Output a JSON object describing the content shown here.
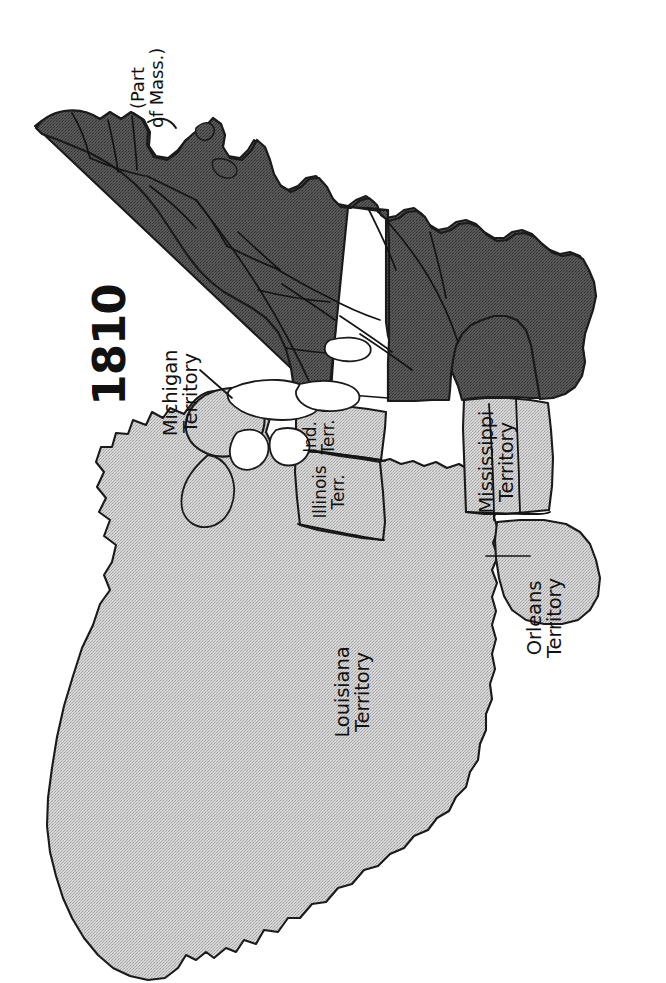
{
  "map": {
    "title": "1810",
    "subject": "United States territorial map, 1810",
    "orientation_degrees": -90,
    "background_color": "#ffffff",
    "colors": {
      "states_fill": "#4f4f4f",
      "territory_fill": "#c9c9c9",
      "outline": "#1a1a1a",
      "label_text": "#111111"
    },
    "labels": [
      {
        "id": "title",
        "text": "1810",
        "x": 110,
        "y": 345,
        "style": "title"
      },
      {
        "id": "part-of-mass",
        "line1": "(Part",
        "line2": "of Mass.)",
        "x": 148,
        "y": 88,
        "style": "note"
      },
      {
        "id": "michigan-territory",
        "line1": "Michigan",
        "line2": "Territory",
        "x": 181,
        "y": 393,
        "style": "terr"
      },
      {
        "id": "indiana-territory",
        "line1": "Ind.",
        "line2": "Terr.",
        "x": 320,
        "y": 437,
        "style": "terr-sm"
      },
      {
        "id": "illinois-territory",
        "line1": "Illinois",
        "line2": "Terr.",
        "x": 330,
        "y": 492,
        "style": "terr-sm"
      },
      {
        "id": "mississippi-territory",
        "line1": "Mississippi",
        "line2": "Territory",
        "x": 497,
        "y": 462,
        "style": "terr"
      },
      {
        "id": "louisiana-territory",
        "line1": "Louisiana",
        "line2": "Territory",
        "x": 353,
        "y": 692,
        "style": "terr"
      },
      {
        "id": "orleans-territory",
        "line1": "Orleans",
        "line2": "Territory",
        "x": 545,
        "y": 618,
        "style": "terr"
      }
    ],
    "regions": [
      {
        "id": "states",
        "name": "United States (17 states)",
        "fill": "states_fill"
      },
      {
        "id": "louisiana-territory",
        "name": "Louisiana Territory",
        "fill": "territory_fill"
      },
      {
        "id": "michigan-territory",
        "name": "Michigan Territory",
        "fill": "territory_fill"
      },
      {
        "id": "illinois-territory",
        "name": "Illinois Territory",
        "fill": "territory_fill"
      },
      {
        "id": "indiana-territory",
        "name": "Indiana Territory",
        "fill": "territory_fill"
      },
      {
        "id": "mississippi-territory",
        "name": "Mississippi Territory",
        "fill": "territory_fill"
      },
      {
        "id": "orleans-territory",
        "name": "Orleans Territory",
        "fill": "territory_fill"
      }
    ],
    "leader_lines": [
      {
        "id": "michigan-leader",
        "from_label": "michigan-territory"
      },
      {
        "id": "orleans-leader",
        "from_label": "orleans-territory"
      }
    ]
  }
}
